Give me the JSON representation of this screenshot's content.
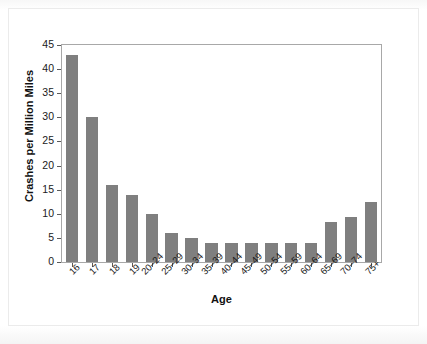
{
  "chart_data": {
    "type": "bar",
    "title": "",
    "subtitle": "",
    "xlabel": "Age",
    "ylabel": "Crashes per Million Miles",
    "categories": [
      "16",
      "17",
      "18",
      "19",
      "20–24",
      "25–29",
      "30–34",
      "35–39",
      "40–44",
      "45–49",
      "50–54",
      "55–59",
      "60–64",
      "65–69",
      "70–74",
      "75+"
    ],
    "values": [
      43,
      30,
      16,
      14,
      10,
      6,
      5,
      4,
      4,
      4,
      4,
      4,
      4,
      8.3,
      9.4,
      12.4
    ],
    "ylim": [
      0,
      45
    ],
    "yticks": [
      0,
      5,
      10,
      15,
      20,
      25,
      30,
      35,
      40,
      45
    ],
    "ytick_labels": [
      "0",
      "5",
      "10",
      "15",
      "20",
      "25",
      "30",
      "35",
      "40",
      "45"
    ],
    "grid": false,
    "legend": false,
    "legend_position": "none",
    "bar_color": "#7f7f7f",
    "axis_color": "#a8a8a8",
    "background_color": "#ffffff",
    "text_color": "#1a1a1a"
  }
}
